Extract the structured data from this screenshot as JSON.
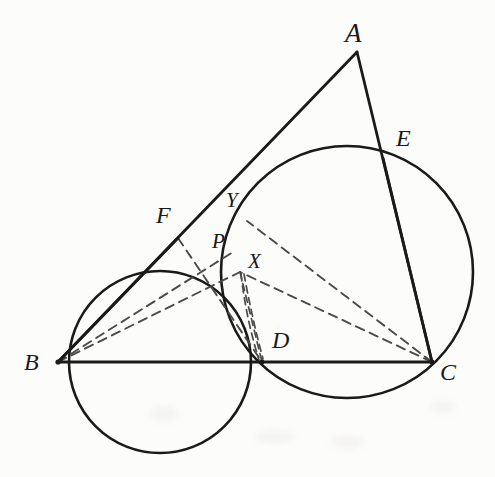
{
  "figure": {
    "kind": "geometry-diagram",
    "background_color": "#fcfcfa",
    "stroke_color": "#1a1a1a",
    "canvas": {
      "width": 495,
      "height": 477
    },
    "points": [
      {
        "id": "A",
        "label": "A",
        "x": 357,
        "y": 52,
        "label_x": 345,
        "label_y": 20,
        "size": "lbl-lg"
      },
      {
        "id": "B",
        "label": "B",
        "x": 58,
        "y": 362,
        "label_x": 24,
        "label_y": 350,
        "size": "lbl-md"
      },
      {
        "id": "C",
        "label": "C",
        "x": 432,
        "y": 362,
        "label_x": 440,
        "label_y": 360,
        "size": "lbl-md"
      },
      {
        "id": "D",
        "label": "D",
        "x": 262,
        "y": 362,
        "label_x": 272,
        "label_y": 328,
        "size": "lbl-md"
      },
      {
        "id": "E",
        "label": "E",
        "x": 383,
        "y": 158,
        "label_x": 396,
        "label_y": 126,
        "size": "lbl-md"
      },
      {
        "id": "F",
        "label": "F",
        "x": 178,
        "y": 238,
        "label_x": 156,
        "label_y": 203,
        "size": "lbl-md"
      },
      {
        "id": "P",
        "label": "P",
        "x": 233,
        "y": 252,
        "label_x": 212,
        "label_y": 231,
        "size": "lbl-sm"
      },
      {
        "id": "X",
        "label": "X",
        "x": 240,
        "y": 272,
        "label_x": 248,
        "label_y": 251,
        "size": "lbl-sm"
      },
      {
        "id": "Y",
        "label": "Y",
        "x": 247,
        "y": 221,
        "label_x": 226,
        "label_y": 190,
        "size": "lbl-sm"
      }
    ],
    "circles": [
      {
        "id": "circle-BFD",
        "through": [
          "B",
          "F",
          "D"
        ],
        "cx": 160,
        "cy": 362,
        "r": 91,
        "style": "solid"
      },
      {
        "id": "circle-DEC",
        "through": [
          "D",
          "E",
          "C"
        ],
        "cx": 347,
        "cy": 272,
        "r": 126,
        "style": "solid"
      }
    ],
    "solid_segments": [
      {
        "id": "seg-AB",
        "from": "A",
        "to": "B",
        "note": "side AB through F, P, Y"
      },
      {
        "id": "seg-AC",
        "from": "A",
        "to": "C",
        "note": "side AC through E"
      },
      {
        "id": "seg-BC",
        "from": "B",
        "to": "C",
        "note": "base through D"
      },
      {
        "id": "seg-BF",
        "from": "B",
        "to": "F",
        "note": "chord of left circle"
      },
      {
        "id": "seg-CE",
        "from": "C",
        "to": "E",
        "note": "chord of right circle"
      }
    ],
    "dashed_segments": [
      {
        "id": "dash-BP",
        "from": "B",
        "to": "P"
      },
      {
        "id": "dash-BX",
        "from": "B",
        "to": "X"
      },
      {
        "id": "dash-FD",
        "from": "F",
        "to": "D"
      },
      {
        "id": "dash-CY",
        "from": "C",
        "to": "Y"
      },
      {
        "id": "dash-CX",
        "from": "C",
        "to": "X"
      },
      {
        "id": "dash-XD",
        "from": "X",
        "to": "D"
      }
    ],
    "lens_region": {
      "id": "lens-XD",
      "between": [
        "X",
        "D"
      ],
      "description": "narrow lens formed where the two circles overlap, with dashed chords inside"
    },
    "caption": ""
  }
}
